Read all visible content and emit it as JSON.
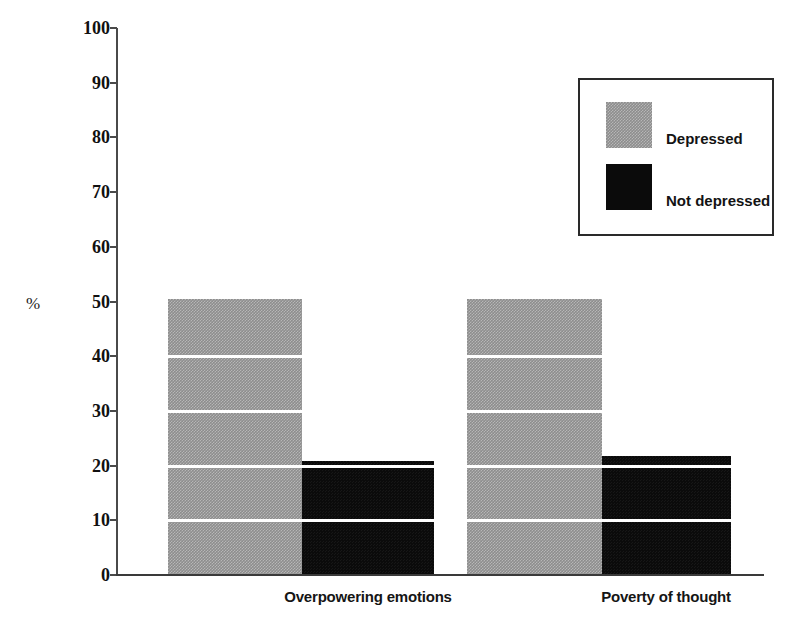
{
  "chart_data": {
    "type": "bar",
    "title": "",
    "subtitle": "",
    "xlabel": "",
    "ylabel": "%",
    "ylim": [
      0,
      100
    ],
    "yticks": [
      0,
      10,
      20,
      30,
      40,
      50,
      60,
      70,
      80,
      90,
      100
    ],
    "ytick_labels": [
      "0",
      "10",
      "20",
      "30",
      "40",
      "50",
      "60",
      "70",
      "80",
      "90",
      "100"
    ],
    "grid": "horizontal-white-lines-over-bars",
    "gridline_values": [
      10,
      20,
      30,
      40
    ],
    "legend_position": "top-right",
    "categories": [
      "Overpowering emotions",
      "Poverty of thought"
    ],
    "series": [
      {
        "name": "Depressed",
        "color": "#8d8d8d",
        "values": [
          50.5,
          50.5
        ]
      },
      {
        "name": "Not depressed",
        "color": "#0b0b0b",
        "values": [
          20.8,
          21.8
        ]
      }
    ]
  },
  "axis": {
    "unit_label": "%"
  },
  "legend": {
    "items": [
      {
        "label": "Depressed"
      },
      {
        "label": "Not depressed"
      }
    ]
  }
}
